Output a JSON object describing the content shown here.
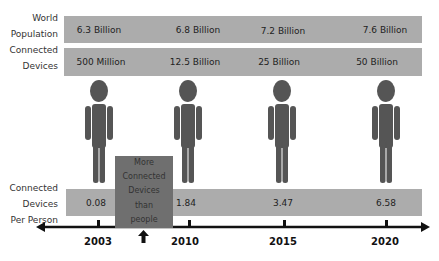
{
  "rows": [
    {
      "label_line1": "World",
      "label_line2": "Population",
      "values": [
        "6.3 Billion",
        "6.8 Billion",
        "7.2 Billion",
        "7.6 Billion"
      ]
    },
    {
      "label_line1": "Connected",
      "label_line2": "Devices",
      "values": [
        "500 Million",
        "12.5 Billion",
        "25 Billion",
        "50 Billion"
      ]
    }
  ],
  "per_person": {
    "label_line1": "Connected",
    "label_line2": "Devices",
    "label_line3": "Per Person",
    "values": [
      "0.08",
      "1.84",
      "3.47",
      "6.58"
    ]
  },
  "callout": {
    "lines": [
      "More",
      "Connected",
      "Devices",
      "than",
      "people"
    ]
  },
  "timeline": {
    "years": [
      "2003",
      "2010",
      "2015",
      "2020"
    ]
  },
  "colors": {
    "band": "#acacac",
    "callout": "#6f6f6f",
    "person": "#555555",
    "axis": "#111111"
  }
}
